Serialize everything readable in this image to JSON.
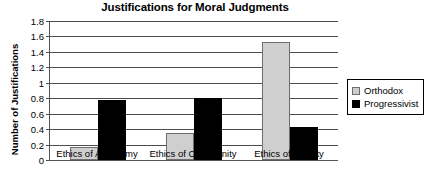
{
  "chart_data": {
    "type": "bar",
    "title": "Justifications for Moral Judgments",
    "xlabel": "",
    "ylabel": "Number of Justifications",
    "categories": [
      "Ethics of Autonomy",
      "Ethics of Community",
      "Ethics of Divinity"
    ],
    "series": [
      {
        "name": "Orthodox",
        "color": "#cfcfcf",
        "values": [
          0.17,
          0.35,
          1.53
        ]
      },
      {
        "name": "Progressivist",
        "color": "#000000",
        "values": [
          0.78,
          0.8,
          0.43
        ]
      }
    ],
    "ylim": [
      0,
      1.8
    ],
    "ytick_step": 0.2,
    "ytick_labels": [
      "0",
      "0.2",
      "0.4",
      "0.6",
      "0.8",
      "1",
      "1.2",
      "1.4",
      "1.6",
      "1.8"
    ],
    "grid": true,
    "legend_position": "right"
  }
}
